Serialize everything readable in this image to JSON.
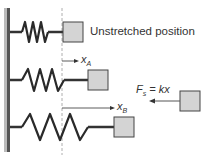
{
  "labels": {
    "unstretched": "Unstretched position",
    "xA": "x",
    "xA_sub": "A",
    "xB": "x",
    "xB_sub": "B",
    "force_lhs": "F",
    "force_sub": "s",
    "force_rhs": " = kx"
  },
  "colors": {
    "block_fill": "#d4d4d4",
    "block_stroke": "#444444",
    "wall": "#555555",
    "spring": "#2a2a2a",
    "dashed": "#999999"
  }
}
